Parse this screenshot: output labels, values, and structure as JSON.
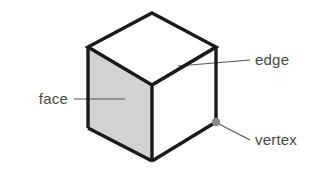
{
  "figure": {
    "background_color": "#ffffff"
  },
  "colors": {
    "outline": "#1a1a1a",
    "front_face_fill": "#d2d2d2",
    "top_face_fill": "#ffffff",
    "hidden_edge": "#9a9a9a",
    "leader_line": "#555555",
    "label_text": "#4a4a4a",
    "vertex_marker": "#888888"
  },
  "shape": {
    "name": "cube",
    "geometry": {
      "top_apex": {
        "x": 152,
        "y": 13
      },
      "top_left": {
        "x": 88,
        "y": 47
      },
      "top_right": {
        "x": 216,
        "y": 47
      },
      "top_front": {
        "x": 152,
        "y": 85
      },
      "bottom_left": {
        "x": 88,
        "y": 128
      },
      "bottom_front": {
        "x": 152,
        "y": 161
      },
      "bottom_right": {
        "x": 216,
        "y": 122
      }
    },
    "faces": [
      {
        "name": "left-front-face",
        "fill": "#d2d2d2"
      },
      {
        "name": "right-front-face",
        "fill": "#ffffff"
      },
      {
        "name": "top-face",
        "fill": "#ffffff"
      }
    ]
  },
  "labels": [
    {
      "id": "face",
      "text": "face",
      "text_anchor": "end",
      "text_x": 68,
      "text_y": 104,
      "leader": {
        "x1": 74,
        "y1": 99,
        "x2": 125,
        "y2": 99
      },
      "points_to": "left-front-face"
    },
    {
      "id": "edge",
      "text": "edge",
      "text_anchor": "start",
      "text_x": 255,
      "text_y": 65,
      "leader": {
        "x1": 250,
        "y1": 60,
        "x2": 178,
        "y2": 66
      },
      "points_to": "top-face-inner-edge"
    },
    {
      "id": "vertex",
      "text": "vertex",
      "text_anchor": "start",
      "text_x": 255,
      "text_y": 145,
      "leader": {
        "x1": 250,
        "y1": 140,
        "x2": 217,
        "y2": 123
      },
      "points_to": "bottom-right-vertex"
    }
  ],
  "markers": [
    {
      "id": "vertex-dot",
      "cx": 216,
      "cy": 122,
      "r": 4.2,
      "fill": "#888888"
    }
  ]
}
